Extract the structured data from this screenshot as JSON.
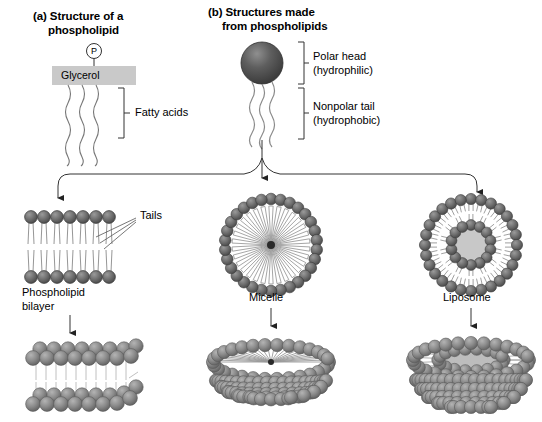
{
  "figure": {
    "title_a_line1": "(a) Structure of a",
    "title_a_line2": "phospholipid",
    "title_b_line1": "(b) Structures made",
    "title_b_line2": "from phospholipids",
    "background_color": "#ffffff",
    "head_color": "#6e6e6e",
    "head_stroke": "#333333",
    "tail_color": "#555555",
    "glycerol_box_color": "#c9c9c9",
    "core_color": "#c8c8c8",
    "line_color": "#333333"
  },
  "panel_a": {
    "phosphate_label": "P",
    "glycerol_label": "Glycerol",
    "fatty_acids_label": "Fatty acids",
    "tail_count": 3
  },
  "panel_b": {
    "polar_head_line1": "Polar head",
    "polar_head_line2": "(hydrophilic)",
    "nonpolar_tail_line1": "Nonpolar tail",
    "nonpolar_tail_line2": "(hydrophobic)",
    "tail_count": 3
  },
  "structures": [
    {
      "name": "bilayer",
      "label_line1": "Phospholipid",
      "label_line2": "bilayer",
      "callout_label": "Tails",
      "lipids_per_leaflet": 8
    },
    {
      "name": "micelle",
      "label_line1": "Micelle",
      "label_line2": "",
      "head_count": 30
    },
    {
      "name": "liposome",
      "label_line1": "Liposome",
      "label_line2": "",
      "outer_head_count": 28,
      "inner_head_count": 14
    }
  ],
  "diagram_data": {
    "type": "diagram",
    "topic": "Phospholipid structure and self-assembled structures",
    "flow": {
      "source": "single phospholipid",
      "branches": [
        "Phospholipid bilayer",
        "Micelle",
        "Liposome"
      ],
      "second_stage": "three-dimensional rendering of each structure"
    }
  }
}
